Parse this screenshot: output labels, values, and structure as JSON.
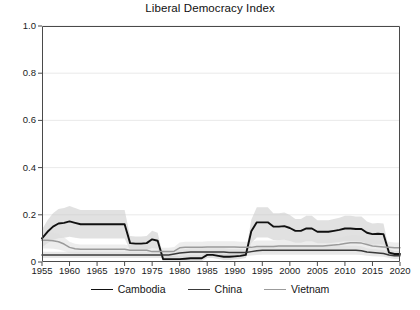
{
  "chart_data": {
    "type": "line",
    "title": "Liberal Democracy Index",
    "xlabel": "",
    "ylabel": "",
    "xlim": [
      1955,
      2020
    ],
    "ylim": [
      0,
      1.0
    ],
    "grid": true,
    "grid_axis": "y",
    "legend_position": "bottom",
    "x_ticks": [
      1955,
      1960,
      1965,
      1970,
      1975,
      1980,
      1985,
      1990,
      1995,
      2000,
      2005,
      2010,
      2015,
      2020
    ],
    "x_tick_labels": [
      "1955",
      "1960",
      "1965",
      "1970",
      "1975",
      "1980",
      "1985",
      "1990",
      "1995",
      "2000",
      "2005",
      "2010",
      "2015",
      "2020"
    ],
    "y_ticks": [
      0,
      0.2,
      0.4,
      0.6,
      0.8,
      1.0
    ],
    "y_tick_labels": [
      "0",
      "0.2",
      "0.4",
      "0.6",
      "0.8",
      "1.0"
    ],
    "x": [
      1955,
      1956,
      1957,
      1958,
      1959,
      1960,
      1961,
      1962,
      1963,
      1964,
      1965,
      1966,
      1967,
      1968,
      1969,
      1970,
      1971,
      1972,
      1973,
      1974,
      1975,
      1976,
      1977,
      1978,
      1979,
      1980,
      1981,
      1982,
      1983,
      1984,
      1985,
      1986,
      1987,
      1988,
      1989,
      1990,
      1991,
      1992,
      1993,
      1994,
      1995,
      1996,
      1997,
      1998,
      1999,
      2000,
      2001,
      2002,
      2003,
      2004,
      2005,
      2006,
      2007,
      2008,
      2009,
      2010,
      2011,
      2012,
      2013,
      2014,
      2015,
      2016,
      2017,
      2018,
      2019,
      2020
    ],
    "series": [
      {
        "name": "Cambodia",
        "color": "#111111",
        "width": 1.9,
        "band_color": "#c9c9c9",
        "values": [
          0.1,
          0.128,
          0.15,
          0.163,
          0.166,
          0.172,
          0.166,
          0.16,
          0.16,
          0.16,
          0.16,
          0.16,
          0.16,
          0.16,
          0.16,
          0.16,
          0.08,
          0.078,
          0.078,
          0.08,
          0.096,
          0.09,
          0.012,
          0.012,
          0.012,
          0.012,
          0.014,
          0.016,
          0.016,
          0.016,
          0.03,
          0.03,
          0.026,
          0.022,
          0.022,
          0.024,
          0.026,
          0.03,
          0.13,
          0.168,
          0.168,
          0.168,
          0.15,
          0.15,
          0.152,
          0.144,
          0.132,
          0.132,
          0.142,
          0.142,
          0.128,
          0.128,
          0.128,
          0.132,
          0.136,
          0.142,
          0.142,
          0.14,
          0.14,
          0.124,
          0.118,
          0.12,
          0.118,
          0.04,
          0.034,
          0.034
        ]
      },
      {
        "name": "China",
        "color": "#3a3a3a",
        "width": 1.5,
        "band_color": "#d6d6d6",
        "values": [
          0.03,
          0.03,
          0.03,
          0.03,
          0.03,
          0.03,
          0.03,
          0.03,
          0.03,
          0.03,
          0.03,
          0.03,
          0.03,
          0.03,
          0.03,
          0.03,
          0.03,
          0.03,
          0.03,
          0.03,
          0.03,
          0.03,
          0.03,
          0.03,
          0.034,
          0.038,
          0.04,
          0.042,
          0.042,
          0.042,
          0.042,
          0.042,
          0.042,
          0.042,
          0.04,
          0.04,
          0.04,
          0.04,
          0.044,
          0.048,
          0.05,
          0.05,
          0.05,
          0.05,
          0.05,
          0.05,
          0.05,
          0.05,
          0.05,
          0.05,
          0.05,
          0.05,
          0.05,
          0.05,
          0.05,
          0.05,
          0.05,
          0.05,
          0.048,
          0.042,
          0.04,
          0.038,
          0.036,
          0.03,
          0.026,
          0.026
        ]
      },
      {
        "name": "Vietnam",
        "color": "#9b9b9b",
        "width": 1.5,
        "band_color": "#dedede",
        "values": [
          0.092,
          0.092,
          0.09,
          0.086,
          0.076,
          0.062,
          0.056,
          0.054,
          0.054,
          0.054,
          0.054,
          0.054,
          0.054,
          0.054,
          0.054,
          0.054,
          0.05,
          0.05,
          0.05,
          0.05,
          0.044,
          0.044,
          0.044,
          0.044,
          0.046,
          0.06,
          0.062,
          0.062,
          0.062,
          0.062,
          0.064,
          0.064,
          0.064,
          0.064,
          0.064,
          0.064,
          0.062,
          0.062,
          0.062,
          0.066,
          0.066,
          0.066,
          0.066,
          0.068,
          0.068,
          0.068,
          0.068,
          0.068,
          0.068,
          0.068,
          0.068,
          0.068,
          0.07,
          0.072,
          0.074,
          0.078,
          0.082,
          0.082,
          0.08,
          0.074,
          0.068,
          0.066,
          0.064,
          0.062,
          0.06,
          0.06
        ]
      }
    ]
  },
  "legend": {
    "items": [
      {
        "label": "Cambodia"
      },
      {
        "label": "China"
      },
      {
        "label": "Vietnam"
      }
    ]
  },
  "axes": {
    "frame_color": "#4a4a4a",
    "grid_color": "#e4e4e4"
  }
}
